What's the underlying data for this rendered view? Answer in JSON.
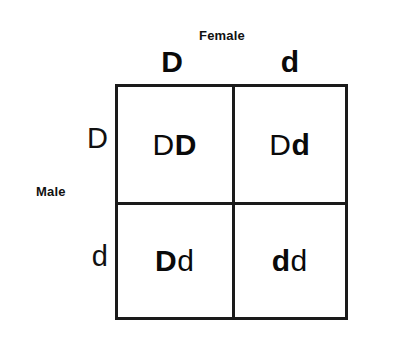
{
  "diagram": {
    "type": "punnett-square",
    "title_female": "Female",
    "title_male": "Male",
    "female_alleles": [
      "D",
      "d"
    ],
    "male_alleles": [
      "D",
      "d"
    ],
    "cells": [
      {
        "id": "cell-0-0",
        "genotype": "DD",
        "male_allele": "D",
        "female_allele": "D"
      },
      {
        "id": "cell-0-1",
        "genotype": "Dd",
        "male_allele": "D",
        "female_allele": "d"
      },
      {
        "id": "cell-1-0",
        "genotype": "Dd",
        "male_allele": "D",
        "female_allele": "d"
      },
      {
        "id": "cell-1-1",
        "genotype": "dd",
        "male_allele": "d",
        "female_allele": "d"
      }
    ],
    "colors": {
      "border": "#1a1a1a",
      "text": "#0a0a0a",
      "background": "#ffffff"
    }
  }
}
